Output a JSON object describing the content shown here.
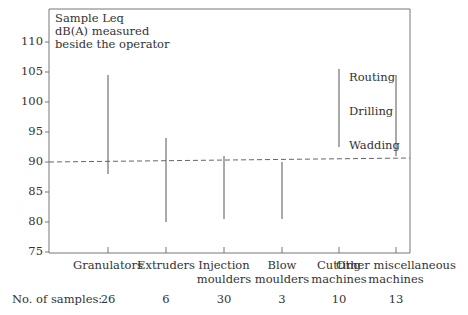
{
  "chart_data": {
    "type": "range",
    "title": "",
    "ylabel": "Sample Leq dB(A) measured beside the operator",
    "ylim": [
      75,
      112
    ],
    "yticks": [
      75,
      80,
      85,
      90,
      95,
      100,
      105,
      110
    ],
    "categories": [
      "Granulators",
      "Extruders",
      "Injection moulders",
      "Blow moulders",
      "Cutting machines",
      "Other miscellaneous machines"
    ],
    "category_lines": [
      [
        "Granulators"
      ],
      [
        "Extruders"
      ],
      [
        "Injection",
        "moulders"
      ],
      [
        "Blow",
        "moulders"
      ],
      [
        "Cutting",
        "machines"
      ],
      [
        "Other miscellaneous",
        "machines"
      ]
    ],
    "series": [
      {
        "name": "Leq range (dB(A))",
        "low": [
          88,
          80,
          80.5,
          80.5,
          92.5,
          91
        ],
        "high": [
          104.5,
          94,
          91,
          90,
          105.5,
          104.5
        ]
      }
    ],
    "reference_line": {
      "value": 90,
      "style": "dashed"
    },
    "samples_label": "No. of samples:",
    "samples": [
      26,
      6,
      30,
      3,
      10,
      13
    ],
    "annotations": [
      "Routing",
      "Drilling",
      "Wadding"
    ],
    "grid": false,
    "legend": null
  }
}
